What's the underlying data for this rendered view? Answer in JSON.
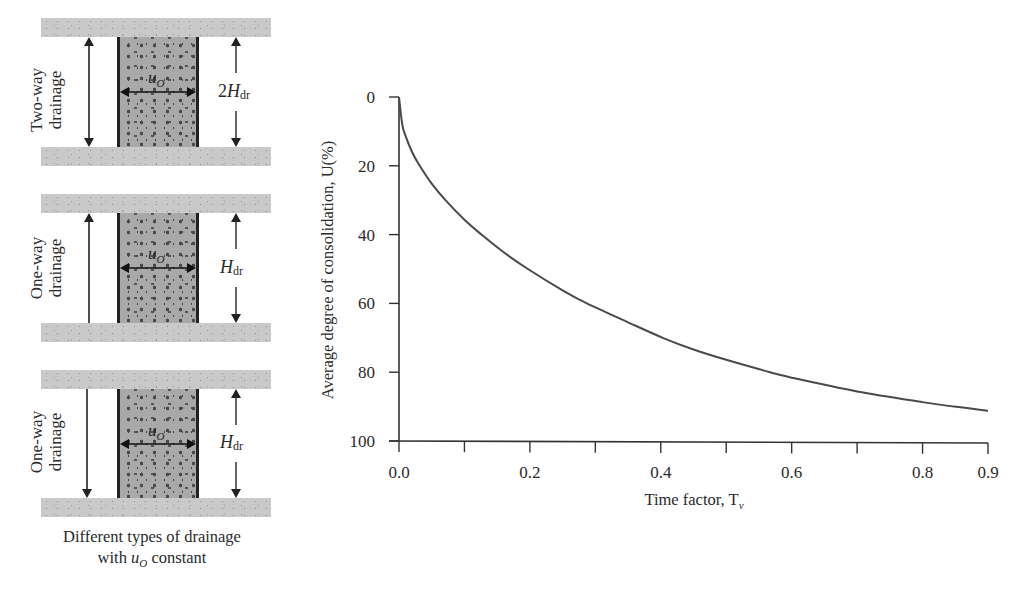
{
  "diagram": {
    "panels": [
      {
        "drainage_label_line1": "Two-way",
        "drainage_label_line2": "drainage",
        "pressure_label": "u",
        "pressure_sub": "O",
        "height_prefix": "2",
        "height_symbol": "H",
        "height_sub": "dr",
        "arrow": "both"
      },
      {
        "drainage_label_line1": "One-way",
        "drainage_label_line2": "drainage",
        "pressure_label": "u",
        "pressure_sub": "O",
        "height_prefix": "",
        "height_symbol": "H",
        "height_sub": "dr",
        "arrow": "up"
      },
      {
        "drainage_label_line1": "One-way",
        "drainage_label_line2": "drainage",
        "pressure_label": "u",
        "pressure_sub": "O",
        "height_prefix": "",
        "height_symbol": "H",
        "height_sub": "dr",
        "arrow": "down"
      }
    ],
    "caption_line1": "Different types of drainage",
    "caption_line2_pre": "with ",
    "caption_line2_var": "u",
    "caption_line2_sub": "O",
    "caption_line2_post": " constant"
  },
  "chart_data": {
    "type": "line",
    "title": "",
    "xlabel": "Time factor, T",
    "xlabel_sub": "v",
    "ylabel": "Average degree of consolidation, U(%)",
    "xlim": [
      0.0,
      0.9
    ],
    "ylim": [
      0,
      100
    ],
    "y_inverted": true,
    "grid": false,
    "legend": null,
    "x_tick_labels": [
      "0.0",
      "0.2",
      "0.4",
      "0.6",
      "0.8",
      "0.9"
    ],
    "x_minor_ticks": [
      0.1,
      0.3,
      0.5,
      0.7
    ],
    "y_tick_labels": [
      "0",
      "20",
      "40",
      "60",
      "80",
      "100"
    ],
    "series": [
      {
        "name": "U vs Tv",
        "color": "#4a4a4a",
        "x": [
          0.0,
          0.005,
          0.01,
          0.02,
          0.03,
          0.05,
          0.071,
          0.1,
          0.126,
          0.159,
          0.197,
          0.25,
          0.287,
          0.35,
          0.403,
          0.45,
          0.5,
          0.567,
          0.6,
          0.7,
          0.8,
          0.848,
          0.9
        ],
        "y": [
          0,
          8.0,
          11.3,
          16.0,
          19.5,
          25.2,
          30.0,
          35.7,
          40.0,
          45.0,
          50.0,
          56.2,
          60.0,
          65.5,
          70.0,
          73.4,
          76.4,
          80.0,
          81.6,
          85.6,
          88.7,
          90.0,
          91.2
        ]
      }
    ]
  }
}
